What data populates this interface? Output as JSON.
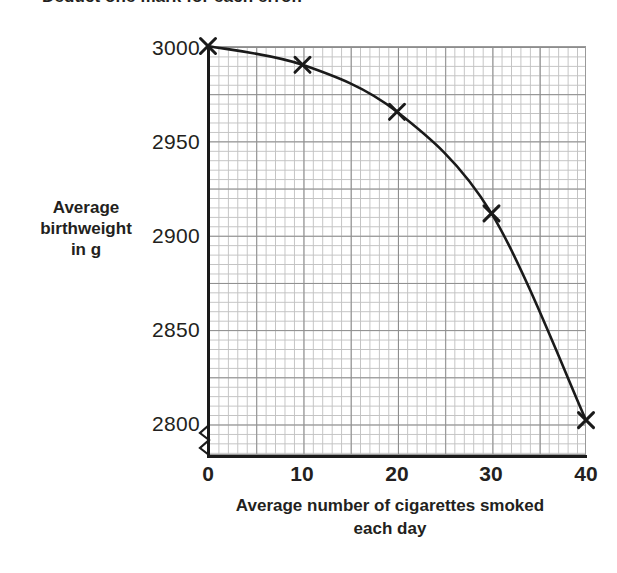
{
  "page": {
    "top_note": "Deduct one mark for each error."
  },
  "axis_titles": {
    "y_line1": "Average",
    "y_line2": "birthweight",
    "y_line3": "in g",
    "x_line1": "Average number of cigarettes smoked",
    "x_line2": "each day"
  },
  "colors": {
    "ink": "#231f20",
    "curve": "#1a1a1a",
    "grid_minor": "#c2c2c2",
    "grid_major": "#8d8d8d",
    "axis": "#1a1a1a",
    "background": "#ffffff"
  },
  "chart_data": {
    "type": "line",
    "title": "",
    "xlabel": "Average number of cigarettes smoked each day",
    "ylabel": "Average birthweight in g",
    "x": [
      0,
      10,
      20,
      30,
      40
    ],
    "values": [
      3000,
      2990,
      2965,
      2911,
      2801
    ],
    "series": [
      {
        "name": "Average birthweight",
        "values": [
          3000,
          2990,
          2965,
          2911,
          2801
        ]
      }
    ],
    "xlim": [
      0,
      40
    ],
    "ylim": [
      2790,
      3003
    ],
    "xticks": [
      0,
      10,
      20,
      30,
      40
    ],
    "xtick_labels": [
      "0",
      "10",
      "20",
      "30",
      "40"
    ],
    "yticks": [
      2800,
      2850,
      2900,
      2950,
      3000
    ],
    "ytick_labels": [
      "2800",
      "2850",
      "2900",
      "2950",
      "3000"
    ],
    "grid": true,
    "grid_minor": true,
    "legend": "none",
    "marker": "x",
    "y_axis_break": true,
    "annotations": []
  }
}
